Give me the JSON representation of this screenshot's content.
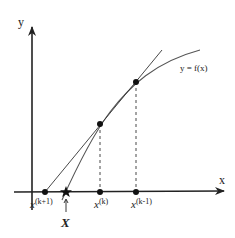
{
  "diagram": {
    "axes": {
      "x_label": "x",
      "y_label": "y"
    },
    "curve_label": "y = f(x)",
    "points": [
      {
        "id": "x_k_plus_1",
        "base": "x",
        "superscript": "(k+1)",
        "x": 45
      },
      {
        "id": "root",
        "label": "X",
        "x": 66,
        "marker": "star"
      },
      {
        "id": "x_k",
        "base": "x",
        "superscript": "(k)",
        "x": 100
      },
      {
        "id": "x_k_minus_1",
        "base": "x",
        "superscript": "(k-1)",
        "x": 136
      }
    ],
    "colors": {
      "line": "#222222",
      "curve": "#555555",
      "background": "#ffffff"
    }
  }
}
